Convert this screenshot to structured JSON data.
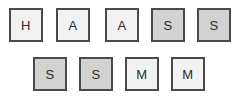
{
  "board": {
    "background_color": "#ffffff",
    "tile_border_color": "#4a4a4a",
    "tile_light_color": "#f2f2f2",
    "tile_dark_color": "#d2d2d2",
    "tile_text_color": "#2b2b2b",
    "rows": [
      {
        "row_index": 0,
        "tiles": [
          {
            "letter": "H",
            "shade": "light",
            "x": 9,
            "y": 8
          },
          {
            "letter": "A",
            "shade": "light",
            "x": 56,
            "y": 8
          },
          {
            "letter": "A",
            "shade": "light",
            "x": 105,
            "y": 8
          },
          {
            "letter": "S",
            "shade": "dark",
            "x": 151,
            "y": 8
          },
          {
            "letter": "S",
            "shade": "dark",
            "x": 197,
            "y": 8
          }
        ]
      },
      {
        "row_index": 1,
        "tiles": [
          {
            "letter": "S",
            "shade": "dark",
            "x": 33,
            "y": 57
          },
          {
            "letter": "S",
            "shade": "dark",
            "x": 79,
            "y": 57
          },
          {
            "letter": "M",
            "shade": "light",
            "x": 125,
            "y": 57
          },
          {
            "letter": "M",
            "shade": "light",
            "x": 171,
            "y": 57
          }
        ]
      }
    ]
  }
}
